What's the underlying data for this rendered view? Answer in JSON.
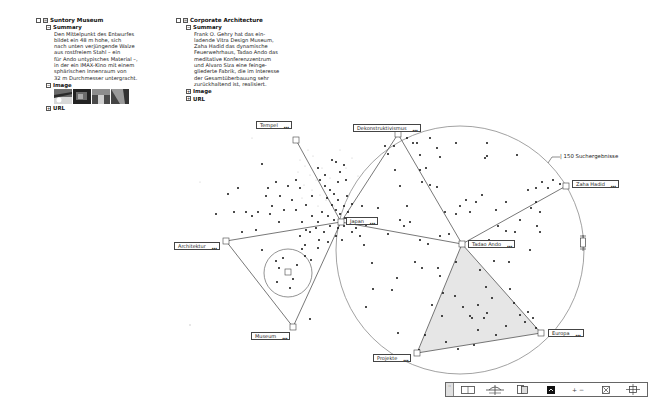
{
  "panels": [
    {
      "title": "Suntory Museum",
      "summary_label": "Summary",
      "summary_text": "Den Mittelpunkt des Entwurfes\nbildet ein 48 m hohe, sich\nnach unten verjüngende Walze\naus rostfreiem Stahl – ein\nfür Ando untypisches Material –,\nin der ein IMAX-Kino mit einem\nsphärischen Innenraum von\n32 m Durchmesser untergracht.",
      "image_label": "Image",
      "image_count": 4,
      "url_label": "URL"
    },
    {
      "title": "Corporate Architecture",
      "summary_label": "Summary",
      "summary_text": "Frank O. Gehry hat das ein-\nladende Vitra Design Museum,\nZaha Hadid das dynamische\nFeuerwehrhaus, Tadao Ando das\nmeditative Konferenzzentrum\nund Alvaro Siza eine feinge-\ngliederte Fabrik, die im Interesse\nder Gesamtüberbauung sehr\nzurückhaltend ist, realisiert.",
      "image_label": "Image",
      "url_label": "URL"
    }
  ],
  "nodes": [
    {
      "id": "tempel",
      "label": "Tempel",
      "x": 296,
      "y": 140
    },
    {
      "id": "dekonstruktivismus",
      "label": "Dekonstruktivismus",
      "x": 398,
      "y": 134
    },
    {
      "id": "japan",
      "label": "Japan",
      "x": 341,
      "y": 222
    },
    {
      "id": "zaha-hadid",
      "label": "Zaha Hadid",
      "x": 566,
      "y": 186
    },
    {
      "id": "tadao-ando",
      "label": "Tadao Ando",
      "x": 462,
      "y": 244
    },
    {
      "id": "architektur",
      "label": "Architektur",
      "x": 226,
      "y": 241
    },
    {
      "id": "museum",
      "label": "Museum",
      "x": 293,
      "y": 327
    },
    {
      "id": "projekte",
      "label": "Projekte",
      "x": 417,
      "y": 353
    },
    {
      "id": "europa",
      "label": "Europa",
      "x": 541,
      "y": 333
    }
  ],
  "result_note": "150 Suchergebnisse",
  "tag_ellipsis": "...",
  "toolbar": {
    "grip": "::",
    "buttons": [
      {
        "name": "layout-view",
        "title": "Layout view"
      },
      {
        "name": "hierarchy-view",
        "title": "Hierarchy"
      },
      {
        "name": "split-view",
        "title": "Split"
      },
      {
        "name": "focus-view",
        "title": "Focus"
      },
      {
        "name": "zoom-plus-minus",
        "title": "+ −"
      },
      {
        "name": "close-box",
        "title": "Close"
      },
      {
        "name": "anchor-view",
        "title": "Anchor"
      }
    ],
    "zoom_label": "+ −"
  },
  "colors": {
    "line": "#555555",
    "circle": "#8a8a8a",
    "fill_triangle": "#e6e6e6",
    "dot": "#111111"
  }
}
